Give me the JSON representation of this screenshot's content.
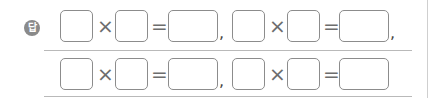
{
  "answer_label": "답",
  "operators": {
    "times": "×",
    "equals": "=",
    "comma": ","
  },
  "rows": [
    {
      "equations": [
        {
          "a": "",
          "b": "",
          "result": ""
        },
        {
          "a": "",
          "b": "",
          "result": ""
        }
      ],
      "trailing": ","
    },
    {
      "equations": [
        {
          "a": "",
          "b": "",
          "result": ""
        },
        {
          "a": "",
          "b": "",
          "result": ""
        }
      ],
      "trailing": ""
    }
  ]
}
